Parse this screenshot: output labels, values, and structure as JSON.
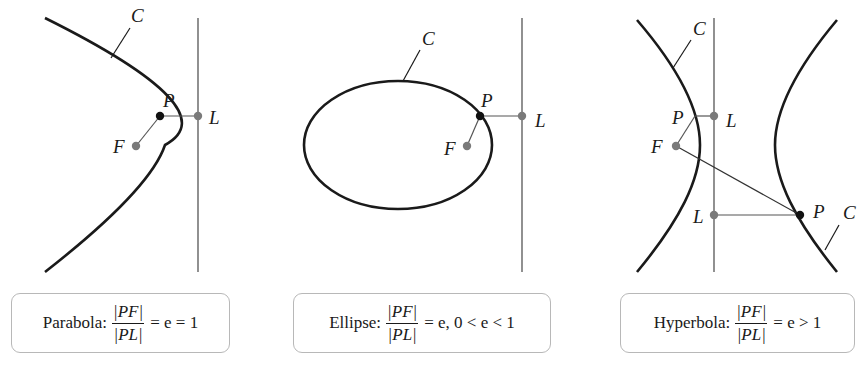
{
  "panels": [
    {
      "id": "parabola",
      "curve_label": "C",
      "point_label": "P",
      "focus_label": "F",
      "directrix_point_label": "L",
      "caption": {
        "name": "Parabola:",
        "numerator": "|PF|",
        "denominator": "|PL|",
        "relation": "= e = 1"
      }
    },
    {
      "id": "ellipse",
      "curve_label": "C",
      "point_label": "P",
      "focus_label": "F",
      "directrix_point_label": "L",
      "caption": {
        "name": "Ellipse:",
        "numerator": "|PF|",
        "denominator": "|PL|",
        "relation": "= e, 0 < e < 1"
      }
    },
    {
      "id": "hyperbola",
      "curve_label": "C",
      "curve_label_2": "C",
      "point_label": "P",
      "point_label_2": "P",
      "focus_label": "F",
      "directrix_point_label": "L",
      "directrix_point_label_2": "L",
      "caption": {
        "name": "Hyperbola:",
        "numerator": "|PF|",
        "denominator": "|PL|",
        "relation": "= e > 1"
      }
    }
  ],
  "colors": {
    "curve": "#1a1a1a",
    "directrix": "#555555",
    "point_on_curve": "#111111",
    "focus_and_directrix_points": "#7a7a7a",
    "box_border": "#b8b8b8"
  }
}
